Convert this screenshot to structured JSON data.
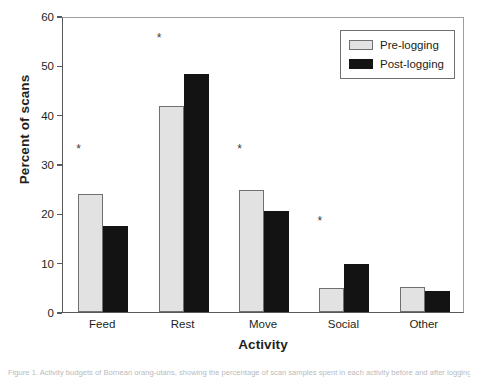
{
  "chart_data": {
    "type": "bar",
    "title": "",
    "xlabel": "Activity",
    "ylabel": "Percent of scans",
    "categories": [
      "Feed",
      "Rest",
      "Move",
      "Social",
      "Other"
    ],
    "ylim": [
      0,
      60
    ],
    "yticks": [
      0,
      10,
      20,
      30,
      40,
      50,
      60
    ],
    "ytick_labels": [
      "0",
      "10",
      "20",
      "30",
      "40",
      "50",
      "60"
    ],
    "grid": false,
    "legend_position": "top-right",
    "series": [
      {
        "name": "Pre-logging",
        "color": "#e2e2e2",
        "values": [
          24.0,
          41.8,
          24.8,
          4.8,
          5.0
        ]
      },
      {
        "name": "Post-logging",
        "color": "#131313",
        "values": [
          17.4,
          48.2,
          20.5,
          9.8,
          4.2
        ]
      }
    ],
    "annotations": [
      {
        "label": "*",
        "category": "Feed",
        "y": 33.5
      },
      {
        "label": "*",
        "category": "Rest",
        "y": 56.0
      },
      {
        "label": "*",
        "category": "Move",
        "y": 33.5
      },
      {
        "label": "*",
        "category": "Social",
        "y": 18.8
      }
    ]
  },
  "caption": "Figure 1. Activity budgets of Bornean orang-utans, showing the percentage of scan samples spent in each activity before and after logging."
}
